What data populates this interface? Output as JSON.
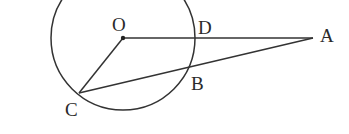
{
  "diagram": {
    "type": "geometry",
    "colors": {
      "stroke": "#333333",
      "text": "#2a2a2a",
      "background": "#ffffff"
    },
    "circle": {
      "center": "O",
      "cx": 123,
      "cy": 38,
      "r": 72
    },
    "points": {
      "O": {
        "label": "O",
        "x": 123,
        "y": 38
      },
      "D": {
        "label": "D",
        "x": 195,
        "y": 38
      },
      "A": {
        "label": "A",
        "x": 313,
        "y": 38
      },
      "B": {
        "label": "B",
        "x": 188,
        "y": 69
      },
      "C": {
        "label": "C",
        "x": 79,
        "y": 93
      }
    },
    "segments": [
      {
        "from": "O",
        "to": "A"
      },
      {
        "from": "C",
        "to": "A"
      },
      {
        "from": "O",
        "to": "C"
      }
    ]
  }
}
